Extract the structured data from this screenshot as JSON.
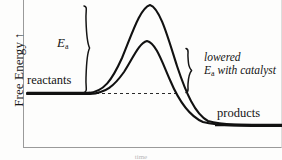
{
  "figure": {
    "kind": "reaction-energy-diagram",
    "background_color": "#fdfdfc",
    "ink_color": "#141414"
  },
  "axes": {
    "y_title": "Free Energy",
    "y_arrow_glyph": "↑",
    "x_title": "time",
    "frame_color": "#8d8d8d"
  },
  "labels": {
    "reactants": "reactants",
    "products": "products",
    "ea_symbol": "E",
    "ea_subscript": "a",
    "lowered_line1": "lowered",
    "lowered_line2_prefix": "E",
    "lowered_line2_subscript": "a",
    "lowered_line2_suffix": " with catalyst"
  },
  "chart_data": {
    "type": "line",
    "title": "",
    "xlabel": "time",
    "ylabel": "Free Energy",
    "grid": false,
    "legend_position": "none",
    "xlim": [
      0,
      282
    ],
    "ylim": [
      160,
      0
    ],
    "annotations": [
      {
        "name": "reactants-label",
        "text": "reactants",
        "x": 27,
        "y": 80
      },
      {
        "name": "products-label",
        "text": "products",
        "x": 217,
        "y": 113
      },
      {
        "name": "ea-label",
        "text": "Ea",
        "x": 57,
        "y": 44
      },
      {
        "name": "lowered-ea-label",
        "text": "lowered Ea with catalyst",
        "x": 204,
        "y": 58
      }
    ],
    "braces": [
      {
        "name": "ea-brace",
        "x": 86,
        "y_top": 5,
        "y_bottom": 93,
        "direction": "right"
      },
      {
        "name": "lowered-ea-brace",
        "x": 190,
        "y_top": 48,
        "y_bottom": 93,
        "direction": "right"
      }
    ],
    "baseline_dashed": {
      "name": "reactant-level-dashed",
      "y": 93,
      "x_start": 90,
      "x_end": 178
    },
    "series": [
      {
        "name": "uncatalyzed",
        "peak": {
          "x": 150,
          "y": 5
        },
        "path": "M 27,93 L 88,93 C 104,92 112,80 122,58 C 132,34 140,8 150,5 C 160,8 168,38 177,66 C 186,93 195,114 208,121 C 222,125 240,125 282,125",
        "description": "higher activation energy barrier without catalyst"
      },
      {
        "name": "catalyzed",
        "peak": {
          "x": 147,
          "y": 41
        },
        "path": "M 27,94 L 90,94 C 106,93 114,86 124,72 C 133,58 139,43 147,41 C 156,43 162,62 170,80 C 178,99 189,116 203,122 C 219,126 242,126 282,126",
        "description": "lowered activation energy barrier with catalyst"
      }
    ],
    "levels": [
      {
        "name": "reactant-level",
        "y": 93,
        "x_start": 27,
        "x_end": 90,
        "label": "reactants"
      },
      {
        "name": "product-level",
        "y": 125,
        "x_start": 215,
        "x_end": 282,
        "label": "products"
      }
    ]
  }
}
